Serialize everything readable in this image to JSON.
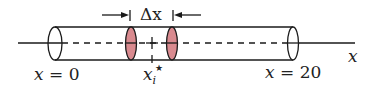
{
  "diagram": {
    "colors": {
      "line": "#1a1a1a",
      "slice_fill": "#d98a8f",
      "background": "#ffffff"
    },
    "labels": {
      "delta": "Δx",
      "left_end_var": "x",
      "left_end_eq": " = 0",
      "right_end_var": "x",
      "right_end_eq": " = 20",
      "sample_point_var": "x",
      "sample_point_sub": "i",
      "sample_point_star": "★",
      "axis": "x"
    }
  }
}
